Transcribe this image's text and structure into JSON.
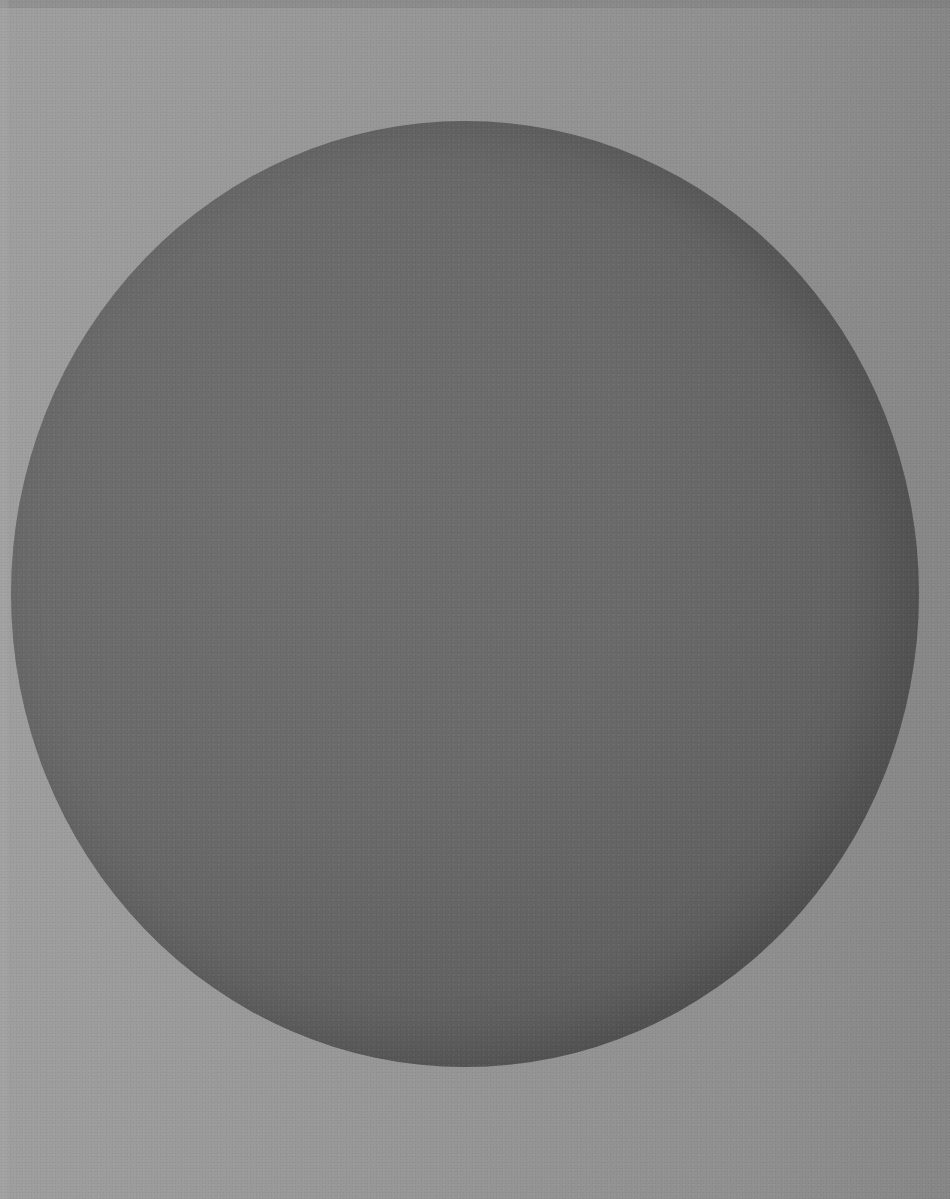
{
  "image": {
    "description": "Abstract image: large dark gray circle centered on a textured lighter gray background",
    "colors": {
      "background": "#979797",
      "disc_light": "#6f6f6f",
      "disc_dark": "#4d4d4d"
    },
    "shapes": [
      {
        "type": "circle",
        "center": [
          465,
          594
        ],
        "radius_x": 454,
        "radius_y": 473
      }
    ]
  }
}
